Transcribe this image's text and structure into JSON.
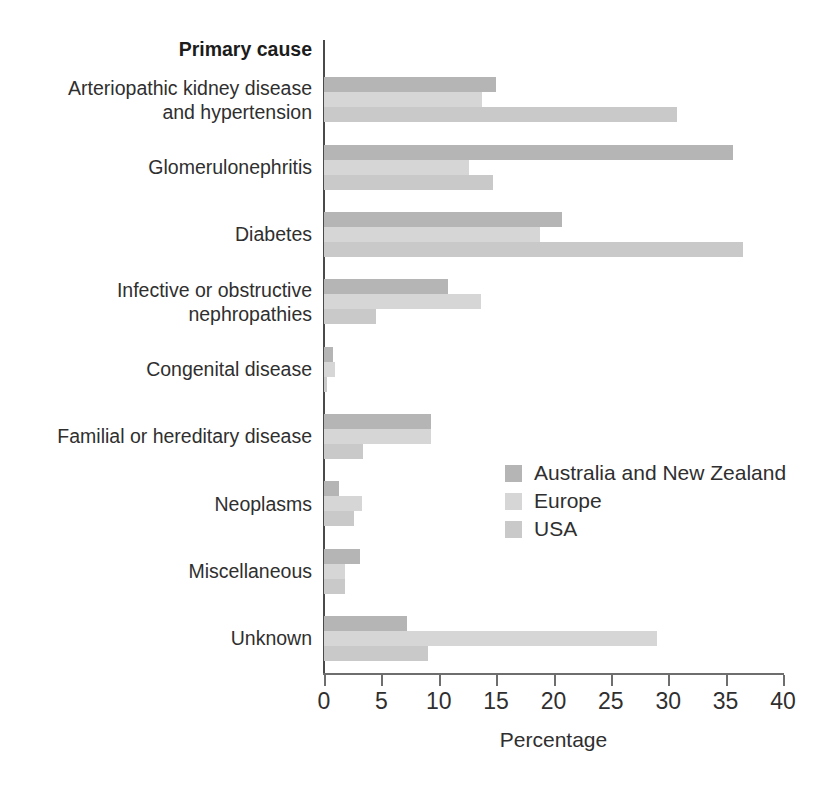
{
  "chart_data": {
    "type": "bar",
    "orientation": "horizontal",
    "title": "",
    "axis_header": "Primary cause",
    "xlabel": "Percentage",
    "ylabel": "",
    "xlim": [
      0,
      40
    ],
    "xticks": [
      0,
      5,
      10,
      15,
      20,
      25,
      30,
      35,
      40
    ],
    "xtick_labels": [
      "0",
      "5",
      "10",
      "15",
      "20",
      "25",
      "30",
      "35",
      "40"
    ],
    "grid": false,
    "legend_position": "center-right",
    "categories": [
      "Arteriopathic kidney disease\nand hypertension",
      "Glomerulonephritis",
      "Diabetes",
      "Infective or obstructive\nnephropathies",
      "Congenital disease",
      "Familial or hereditary disease",
      "Neoplasms",
      "Miscellaneous",
      "Unknown"
    ],
    "series": [
      {
        "name": "Australia and New Zealand",
        "color": "#b5b5b5",
        "values": [
          15.0,
          35.6,
          20.7,
          10.8,
          0.8,
          9.3,
          1.3,
          3.1,
          7.2
        ]
      },
      {
        "name": "Europe",
        "color": "#d6d6d6",
        "values": [
          13.8,
          12.6,
          18.8,
          13.7,
          1.0,
          9.3,
          3.3,
          1.8,
          29.0
        ]
      },
      {
        "name": "USA",
        "color": "#c9c9c9",
        "values": [
          30.8,
          14.7,
          36.5,
          4.5,
          0.3,
          3.4,
          2.6,
          1.8,
          9.1
        ]
      }
    ]
  }
}
